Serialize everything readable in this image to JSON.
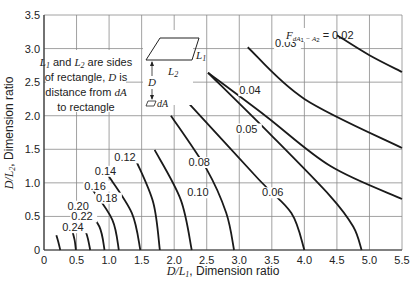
{
  "chart_data": {
    "type": "line",
    "title": "",
    "xlabel": "D/L1, Dimension ratio",
    "ylabel": "D/L2, Dimension ratio",
    "xlim": [
      0,
      5.5
    ],
    "ylim": [
      0,
      3.5
    ],
    "grid": true,
    "x_ticks": [
      "0",
      "0.5",
      "1.0",
      "1.5",
      "2.0",
      "2.5",
      "3.0",
      "3.5",
      "4.0",
      "4.5",
      "5.0",
      "5.5"
    ],
    "y_ticks": [
      "0",
      "0.5",
      "1.0",
      "1.5",
      "2.0",
      "2.5",
      "3.0",
      "3.5"
    ],
    "series": [
      {
        "name": "0.24",
        "points": [
          [
            0.19,
            0.22
          ],
          [
            0.22,
            0.12
          ],
          [
            0.25,
            0
          ]
        ],
        "label_pos": [
          0.28,
          0.28
        ]
      },
      {
        "name": "0.22",
        "points": [
          [
            0.42,
            0.34
          ],
          [
            0.47,
            0.15
          ],
          [
            0.49,
            0
          ]
        ],
        "label_pos": [
          0.42,
          0.44
        ]
      },
      {
        "name": "0.20",
        "points": [
          [
            0.52,
            0.5
          ],
          [
            0.65,
            0.25
          ],
          [
            0.71,
            0
          ]
        ],
        "label_pos": [
          0.36,
          0.6
        ]
      },
      {
        "name": "0.18",
        "points": [
          [
            0.6,
            0.68
          ],
          [
            0.85,
            0.35
          ],
          [
            0.93,
            0
          ]
        ],
        "label_pos": [
          0.8,
          0.72
        ]
      },
      {
        "name": "0.16",
        "points": [
          [
            0.73,
            0.92
          ],
          [
            1.05,
            0.45
          ],
          [
            1.15,
            0
          ]
        ],
        "label_pos": [
          0.62,
          0.9
        ]
      },
      {
        "name": "0.14",
        "points": [
          [
            0.98,
            1.12
          ],
          [
            1.35,
            0.55
          ],
          [
            1.48,
            0
          ]
        ],
        "label_pos": [
          0.78,
          1.12
        ]
      },
      {
        "name": "0.12",
        "points": [
          [
            1.42,
            1.32
          ],
          [
            1.68,
            0.7
          ],
          [
            1.78,
            0
          ]
        ],
        "label_pos": [
          1.08,
          1.32
        ]
      },
      {
        "name": "0.10",
        "points": [
          [
            1.7,
            1.49
          ],
          [
            2.1,
            0.75
          ],
          [
            2.27,
            0
          ]
        ],
        "label_pos": [
          2.2,
          0.8
        ]
      },
      {
        "name": "0.08",
        "points": [
          [
            1.95,
            2.0
          ],
          [
            2.5,
            1.2
          ],
          [
            2.8,
            0.55
          ],
          [
            2.92,
            0
          ]
        ],
        "label_pos": [
          2.22,
          1.25
        ]
      },
      {
        "name": "0.06",
        "points": [
          [
            2.21,
            2.2
          ],
          [
            3.3,
            1.05
          ],
          [
            3.8,
            0.55
          ],
          [
            4.0,
            0
          ]
        ],
        "label_pos": [
          3.35,
          0.8
        ]
      },
      {
        "name": "0.05",
        "points": [
          [
            2.52,
            2.64
          ],
          [
            3.5,
            1.7
          ],
          [
            4.4,
            0.8
          ],
          [
            4.75,
            0.35
          ],
          [
            4.88,
            0
          ]
        ],
        "label_pos": [
          2.95,
          1.75
        ]
      },
      {
        "name": "0.04",
        "points": [
          [
            3.13,
            3.02
          ],
          [
            4.0,
            2.25
          ],
          [
            4.8,
            1.75
          ],
          [
            5.5,
            1.52
          ]
        ],
        "label_pos": [
          3.0,
          2.32
        ],
        "note": "continues from upper-left start"
      },
      {
        "name": "0.03",
        "points": [
          [
            3.13,
            3.02
          ],
          [
            4.0,
            2.25
          ],
          [
            5.5,
            1.52
          ]
        ],
        "label_pos": [
          3.55,
          3.02
        ]
      },
      {
        "name": "0.02",
        "points": [
          [
            4.5,
            3.2
          ],
          [
            5.0,
            2.9
          ],
          [
            5.5,
            2.65
          ]
        ],
        "label_pos": [
          3.9,
          3.2
        ]
      }
    ],
    "annotations": [
      "F_dA1-A2 = 0.02",
      "L1 and L2 are sides of rectangle, D is distance from dA to rectangle"
    ]
  },
  "axes": {
    "x_label_main": "D/L",
    "x_label_sub": "1",
    "x_label_rest": ", Dimension ratio",
    "y_label_main": "D/L",
    "y_label_sub": "2",
    "y_label_rest": ", Dimension ratio"
  },
  "legend_note": {
    "line1_a": "L",
    "line1_sub1": "1",
    "line1_b": " and ",
    "line1_c": "L",
    "line1_sub2": "2",
    "line1_d": " are sides",
    "line2_a": "of rectangle, ",
    "line2_b": "D",
    "line2_c": " is",
    "line3_a": "distance from ",
    "line3_b": "dA",
    "line4": "to rectangle"
  },
  "inset": {
    "L1": "L",
    "L1_sub": "1",
    "L2": "L",
    "L2_sub": "2",
    "D": "D",
    "dA": "dA"
  },
  "factor_label": {
    "F": "F",
    "sub": "dA",
    "sub2": "1",
    "sub3": " − A",
    "sub4": "2",
    "eq": " = 0.02"
  },
  "colors": {
    "curve": "#1a1a1a",
    "grid": "#8a8a8a",
    "axis": "#333333",
    "text": "#222222"
  }
}
